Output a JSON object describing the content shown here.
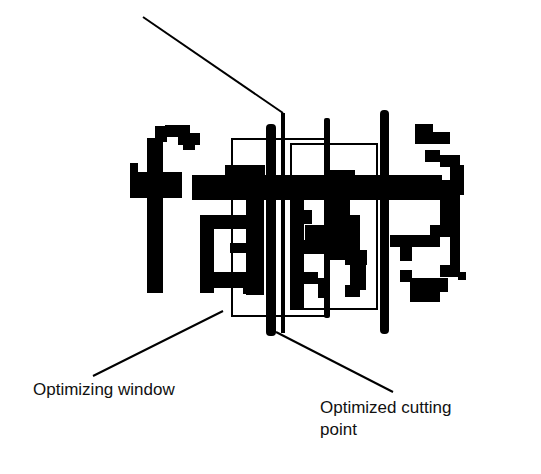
{
  "figure": {
    "labels": {
      "window": "Optimizing window",
      "cut_line1": "Optimized cutting",
      "cut_line2": "point"
    },
    "colors": {
      "ink": "#000000",
      "background": "#ffffff"
    }
  }
}
